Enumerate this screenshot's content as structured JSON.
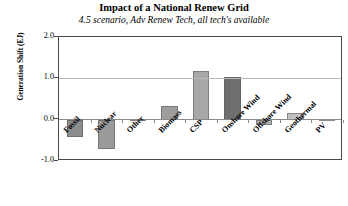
{
  "chart_data": {
    "type": "bar",
    "title": "Impact of a National Renew Grid",
    "subtitle": "4.5 scenario, Adv Renew Tech,  all tech's available",
    "xlabel": "",
    "ylabel": "Generation Shift (EJ)",
    "ylim": [
      -1.0,
      2.0
    ],
    "yticks": [
      "2.0",
      "1.0",
      "0.0",
      "-1.0"
    ],
    "ytick_values": [
      2.0,
      1.0,
      0.0,
      -1.0
    ],
    "grid": true,
    "legend": "none",
    "categories": [
      "Fossil",
      "Nuclear",
      "Other",
      "Biomass",
      "CSP",
      "Onshore Wind",
      "Offshore Wind",
      "Geothermal",
      "PV"
    ],
    "values": [
      -0.42,
      -0.72,
      0.02,
      0.34,
      1.17,
      1.04,
      -0.12,
      0.15,
      0.02
    ],
    "bar_colors": [
      "#8c8c8c",
      "#9a9a9a",
      "#bdbdbd",
      "#9e9e9e",
      "#a8a8a8",
      "#6f6f6f",
      "#b0b0b0",
      "#c2c2c2",
      "#c8c8c8"
    ]
  },
  "style": {
    "frame_color": "#4a4a4a",
    "grid_color": "#b9b9b9",
    "zero_line_color": "#8a8a8a",
    "background": "#ffffff"
  }
}
